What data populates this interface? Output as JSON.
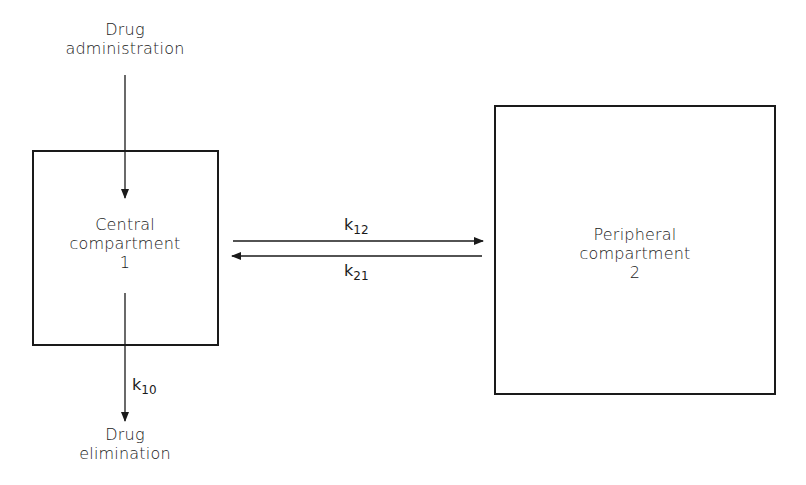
{
  "diagram": {
    "input": {
      "line1": "Drug",
      "line2": "administration"
    },
    "output": {
      "line1": "Drug",
      "line2": "elimination"
    },
    "central": {
      "line1": "Central",
      "line2": "compartment",
      "number": "1"
    },
    "peripheral": {
      "line1": "Peripheral",
      "line2": "compartment",
      "number": "2"
    },
    "rates": {
      "k12": {
        "base": "k",
        "sub": "12"
      },
      "k21": {
        "base": "k",
        "sub": "21"
      },
      "k10": {
        "base": "k",
        "sub": "10"
      }
    },
    "colors": {
      "line": "#1a1a1a",
      "background": "#ffffff"
    }
  }
}
